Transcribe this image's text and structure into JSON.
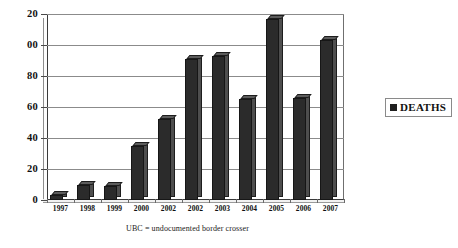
{
  "chart_data": {
    "type": "bar",
    "title": "",
    "xlabel": "",
    "ylabel": "",
    "categories": [
      "1997",
      "1998",
      "1999",
      "2000",
      "2002",
      "2002",
      "2003",
      "2004",
      "2005",
      "2006",
      "2007"
    ],
    "values": [
      3,
      10,
      9,
      35,
      52,
      91,
      93,
      65,
      117,
      66,
      103
    ],
    "series": [
      {
        "name": "DEATHS",
        "values": [
          3,
          10,
          9,
          35,
          52,
          91,
          93,
          65,
          117,
          66,
          103
        ]
      }
    ],
    "ylim": [
      0,
      120
    ],
    "yticks": [
      0,
      20,
      40,
      60,
      80,
      100,
      120
    ],
    "ytick_labels": [
      "0",
      "20",
      "40",
      "60",
      "80",
      "00",
      "20"
    ],
    "grid": true,
    "legend_position": "right",
    "bar_color": "#2b2b2b"
  },
  "legend": {
    "entries": [
      {
        "label": "DEATHS",
        "color": "#1f1f1f",
        "marker": "square-marker"
      }
    ]
  },
  "caption": {
    "text": "UBC = undocumented border crosser"
  }
}
